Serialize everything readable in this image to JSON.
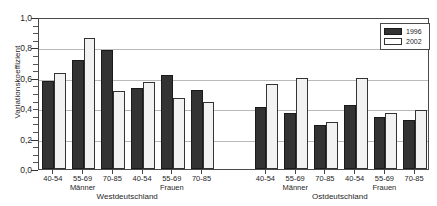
{
  "chart_data": {
    "type": "bar",
    "title": "",
    "xlabel": "",
    "ylabel": "Variationskoeffizient",
    "ylim": [
      0.0,
      1.0
    ],
    "ytick_labels": [
      "0,0",
      "0,2",
      "0,4",
      "0,6",
      "0,8",
      "1,0"
    ],
    "ytick_values": [
      0.0,
      0.2,
      0.4,
      0.6,
      0.8,
      1.0
    ],
    "grid": true,
    "legend_position": "top-right",
    "categories": [
      "40-54",
      "55-69",
      "70-85",
      "40-54",
      "55-69",
      "70-85",
      "40-54",
      "55-69",
      "70-85",
      "40-54",
      "55-69",
      "70-85"
    ],
    "group_labels": {
      "sex": [
        "Männer",
        "Frauen",
        "Männer",
        "Frauen"
      ],
      "region": [
        "Westdeutschland",
        "Ostdeutschland"
      ]
    },
    "series": [
      {
        "name": "1996",
        "color": "#333333",
        "values": [
          0.58,
          0.72,
          0.78,
          0.53,
          0.62,
          0.52,
          0.41,
          0.37,
          0.29,
          0.42,
          0.34,
          0.32
        ]
      },
      {
        "name": "2002",
        "color": "#f2f2f2",
        "values": [
          0.63,
          0.86,
          0.51,
          0.57,
          0.47,
          0.44,
          0.56,
          0.6,
          0.31,
          0.6,
          0.37,
          0.39
        ]
      }
    ]
  },
  "axis": {
    "y_title": "Variationskoeffizient",
    "y_labels": [
      "1,0",
      "0,8",
      "0,6",
      "0,4",
      "0,2",
      "0,0"
    ],
    "x_group_labels": [
      "40-54",
      "55-69",
      "70-85",
      "40-54",
      "55-69",
      "70-85",
      "40-54",
      "55-69",
      "70-85",
      "40-54",
      "55-69",
      "70-85"
    ],
    "sex_labels": [
      "Männer",
      "Frauen",
      "Männer",
      "Frauen"
    ],
    "region_labels": [
      "Westdeutschland",
      "Ostdeutschland"
    ]
  },
  "legend": {
    "items": [
      {
        "label": "1996",
        "key": "s1996"
      },
      {
        "label": "2002",
        "key": "s2002"
      }
    ]
  }
}
